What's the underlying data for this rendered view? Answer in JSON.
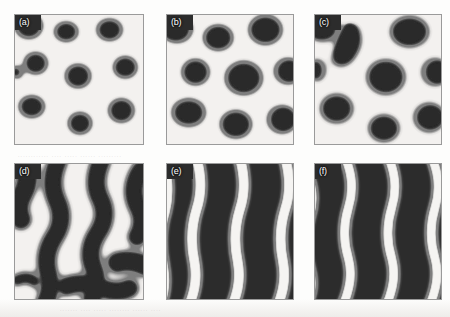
{
  "figure": {
    "type": "multi-panel-simulation-micrograph",
    "layout": {
      "rows": 2,
      "cols": 3
    },
    "colors": {
      "domain_core": "#2c2c2c",
      "domain_halo": "#7e7e7e",
      "matrix_background": "#f3f1ef",
      "panel_border": "#9a9a9a",
      "page_background": "#fdfdfc",
      "label_text": "#ffffff"
    },
    "panels": [
      {
        "id": "a",
        "label": "(a)",
        "morphology": "isolated circular droplets",
        "description": "Sparse dark circular domains with gray interfacial halos on a light matrix",
        "droplet_count": 10,
        "area_fraction": 0.22
      },
      {
        "id": "b",
        "label": "(b)",
        "morphology": "enlarged circular droplets",
        "description": "Larger, more densely packed dark circular domains with gray halos",
        "droplet_count": 11,
        "area_fraction": 0.36
      },
      {
        "id": "c",
        "label": "(c)",
        "morphology": "coalescing elongated domains",
        "description": "Domains begin to merge and elongate into irregular lobes",
        "droplet_count": 9,
        "area_fraction": 0.46
      },
      {
        "id": "d",
        "label": "(d)",
        "morphology": "labyrinthine worm-like stripes",
        "description": "Connected meandering dark bands separated by light channels",
        "droplet_count": 0,
        "area_fraction": 0.58
      },
      {
        "id": "e",
        "label": "(e)",
        "morphology": "diagonal lamellar stripes",
        "description": "Wavy light stripes running diagonally across a dark matrix",
        "stripe_count": 4,
        "stripe_tilt_deg": 14,
        "area_fraction": 0.76
      },
      {
        "id": "f",
        "label": "(f)",
        "morphology": "dense diagonal lamellar stripes",
        "description": "Narrower, more closely spaced light stripes on a dark matrix",
        "stripe_count": 4,
        "stripe_tilt_deg": 18,
        "area_fraction": 0.78
      }
    ],
    "bleed_through_text": {
      "row_middle": "............ .... ..... ...... .........",
      "row_bottom": "....... .... ..... ........ ...... ...."
    }
  }
}
